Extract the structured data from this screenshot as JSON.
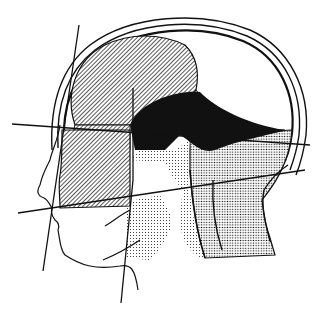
{
  "figure": {
    "type": "anatomical-line-drawing",
    "regions": [
      {
        "id": "cerebrum-upper",
        "fill": "diagonal-hatch"
      },
      {
        "id": "frontal-lower",
        "fill": "diagonal-hatch"
      },
      {
        "id": "face-block",
        "fill": "diagonal-hatch"
      },
      {
        "id": "deep-region",
        "fill": "solid-black"
      },
      {
        "id": "occipital-region",
        "fill": "white"
      },
      {
        "id": "brainstem-neck",
        "fill": "dot-stipple"
      },
      {
        "id": "posterior-neck",
        "fill": "dot-stipple"
      }
    ],
    "reference_lines": 5,
    "colors": {
      "ink": "#111111",
      "paper": "#ffffff"
    }
  }
}
